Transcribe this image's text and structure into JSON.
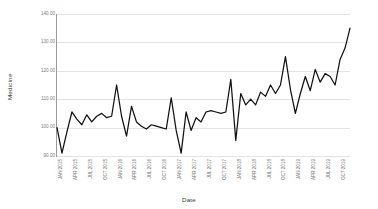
{
  "chart_data": {
    "type": "line",
    "title": "",
    "xlabel": "Date",
    "ylabel": "Medicine",
    "ylim": [
      90,
      140
    ],
    "yticks": [
      90,
      130,
      110,
      120,
      140,
      100
    ],
    "ytick_labels": [
      "140.00",
      "130.00",
      "120.00",
      "110.00",
      "100.00",
      "90.00"
    ],
    "grid": true,
    "legend": "none",
    "line_color": "#111111",
    "grid_color": "#e3e3e3",
    "axis_color": "#9a9a9a",
    "x_tick_labels": [
      "JAN 2015",
      "APR 2015",
      "JUL 2015",
      "OCT 2015",
      "JAN 2016",
      "APR 2016",
      "JUL 2016",
      "OCT 2016",
      "JAN 2017",
      "APR 2017",
      "JUL 2017",
      "OCT 2017",
      "JAN 2018",
      "APR 2018",
      "JUL 2018",
      "OCT 2018",
      "JAN 2019",
      "APR 2019",
      "JUL 2019",
      "OCT 2019"
    ],
    "x": [
      "JAN 2015",
      "FEB 2015",
      "MAR 2015",
      "APR 2015",
      "MAY 2015",
      "JUN 2015",
      "JUL 2015",
      "AUG 2015",
      "SEP 2015",
      "OCT 2015",
      "NOV 2015",
      "DEC 2015",
      "JAN 2016",
      "FEB 2016",
      "MAR 2016",
      "APR 2016",
      "MAY 2016",
      "JUN 2016",
      "JUL 2016",
      "AUG 2016",
      "SEP 2016",
      "OCT 2016",
      "NOV 2016",
      "DEC 2016",
      "JAN 2017",
      "FEB 2017",
      "MAR 2017",
      "APR 2017",
      "MAY 2017",
      "JUN 2017",
      "JUL 2017",
      "AUG 2017",
      "SEP 2017",
      "OCT 2017",
      "NOV 2017",
      "DEC 2017",
      "JAN 2018",
      "FEB 2018",
      "MAR 2018",
      "APR 2018",
      "MAY 2018",
      "JUN 2018",
      "JUL 2018",
      "AUG 2018",
      "SEP 2018",
      "OCT 2018",
      "NOV 2018",
      "DEC 2018",
      "JAN 2019",
      "FEB 2019",
      "MAR 2019",
      "APR 2019",
      "MAY 2019",
      "JUN 2019",
      "JUL 2019",
      "AUG 2019",
      "SEP 2019",
      "OCT 2019",
      "NOV 2019",
      "DEC 2019"
    ],
    "values": [
      100.0,
      91.0,
      98.5,
      105.5,
      103.0,
      101.0,
      104.5,
      102.0,
      104.0,
      105.0,
      103.5,
      104.0,
      115.0,
      104.0,
      97.0,
      107.5,
      102.0,
      100.5,
      99.5,
      101.0,
      100.5,
      100.0,
      99.5,
      110.5,
      99.0,
      91.0,
      105.5,
      99.0,
      103.5,
      102.0,
      105.5,
      106.0,
      105.5,
      105.0,
      105.5,
      117.0,
      95.5,
      112.0,
      108.0,
      110.0,
      108.0,
      112.5,
      111.0,
      115.0,
      112.0,
      115.0,
      125.0,
      113.5,
      105.0,
      112.0,
      118.0,
      113.0,
      120.5,
      116.0,
      119.0,
      118.0,
      115.0,
      124.0,
      128.0,
      135.0
    ]
  }
}
